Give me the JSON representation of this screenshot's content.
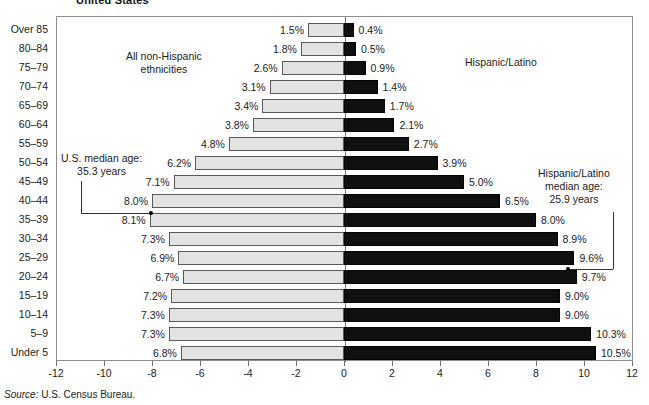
{
  "title": "United States",
  "source": {
    "label": "Source:",
    "text": "U.S. Census Bureau."
  },
  "captions": {
    "left_group_line1": "All non-Hispanic",
    "left_group_line2": "ethnicities",
    "right_group": "Hispanic/Latino"
  },
  "annotations": {
    "us_median_line1": "U.S. median age:",
    "us_median_line2": "35.3 years",
    "hl_median_line1": "Hispanic/Latino",
    "hl_median_line2": "median age:",
    "hl_median_line3": "25.9 years"
  },
  "axis": {
    "ticks": [
      "-12",
      "-10",
      "-8",
      "-6",
      "-4",
      "-2",
      "0",
      "2",
      "4",
      "6",
      "8",
      "10",
      "12"
    ],
    "tick_values": [
      -12,
      -10,
      -8,
      -6,
      -4,
      -2,
      0,
      2,
      4,
      6,
      8,
      10,
      12
    ]
  },
  "chart_data": {
    "type": "bar",
    "title": "United States",
    "subtype": "population-pyramid",
    "xlabel": "",
    "ylabel": "",
    "xlim": [
      -12,
      12
    ],
    "grid": false,
    "legend_position": "in-plot",
    "categories": [
      "Over 85",
      "80–84",
      "75–79",
      "70–74",
      "65–69",
      "60–64",
      "55–59",
      "50–54",
      "45–49",
      "40–44",
      "35–39",
      "30–34",
      "25–29",
      "20–24",
      "15–19",
      "10–14",
      "5–9",
      "Under 5"
    ],
    "series": [
      {
        "name": "All non-Hispanic ethnicities",
        "side": "left",
        "color": "#e3e3e3",
        "values": [
          1.5,
          1.8,
          2.6,
          3.1,
          3.4,
          3.8,
          4.8,
          6.2,
          7.1,
          8.0,
          8.1,
          7.3,
          6.9,
          6.7,
          7.2,
          7.3,
          7.3,
          6.8
        ],
        "labels": [
          "1.5%",
          "1.8%",
          "2.6%",
          "3.1%",
          "3.4%",
          "3.8%",
          "4.8%",
          "6.2%",
          "7.1%",
          "8.0%",
          "8.1%",
          "7.3%",
          "6.9%",
          "6.7%",
          "7.2%",
          "7.3%",
          "7.3%",
          "6.8%"
        ]
      },
      {
        "name": "Hispanic/Latino",
        "side": "right",
        "color": "#101010",
        "values": [
          0.4,
          0.5,
          0.9,
          1.4,
          1.7,
          2.1,
          2.7,
          3.9,
          5.0,
          6.5,
          8.0,
          8.9,
          9.6,
          9.7,
          9.0,
          9.0,
          10.3,
          10.5
        ],
        "labels": [
          "0.4%",
          "0.5%",
          "0.9%",
          "1.4%",
          "1.7%",
          "2.1%",
          "2.7%",
          "3.9%",
          "5.0%",
          "6.5%",
          "8.0%",
          "8.9%",
          "9.6%",
          "9.7%",
          "9.0%",
          "9.0%",
          "10.3%",
          "10.5%"
        ]
      }
    ],
    "annotations": [
      {
        "name": "us-median-age",
        "text": "U.S. median age: 35.3 years",
        "points_to_category": "40–44"
      },
      {
        "name": "hispanic-latino-median-age",
        "text": "Hispanic/Latino median age: 25.9 years",
        "points_to_category": "25–29"
      }
    ]
  }
}
